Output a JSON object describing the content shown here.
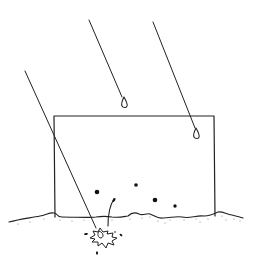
{
  "illustration": {
    "subject": "raindrops falling on a box resting on the ground, one drop splashing into soil",
    "stroke_color": "#222222",
    "background": "#ffffff",
    "box": {
      "x": 54,
      "y": 116,
      "width": 160,
      "height": 101
    },
    "rain_streaks": [
      {
        "x1": 25,
        "y1": 71,
        "x2": 96,
        "y2": 228
      },
      {
        "x1": 89,
        "y1": 20,
        "x2": 122,
        "y2": 97
      },
      {
        "x1": 153,
        "y1": 22,
        "x2": 195,
        "y2": 128
      }
    ],
    "droplets": [
      {
        "cx": 125,
        "cy": 104
      },
      {
        "cx": 197,
        "cy": 136
      }
    ],
    "dots": [
      {
        "cx": 97,
        "cy": 192,
        "r": 2.3
      },
      {
        "cx": 136,
        "cy": 185,
        "r": 1.8
      },
      {
        "cx": 155,
        "cy": 200,
        "r": 2.3
      },
      {
        "cx": 175,
        "cy": 206,
        "r": 1.7
      }
    ]
  }
}
